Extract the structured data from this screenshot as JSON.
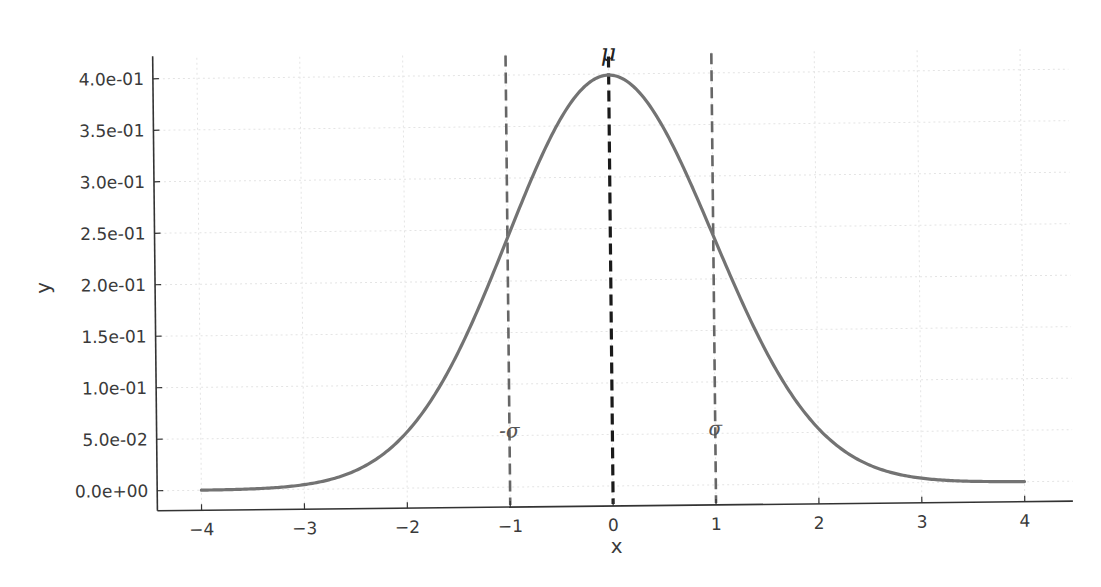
{
  "chart_data": {
    "type": "line",
    "title": "",
    "xlabel": "x",
    "ylabel": "y",
    "xlim": [
      -4.4,
      4.4
    ],
    "ylim": [
      -0.02,
      0.42
    ],
    "grid": true,
    "legend": null,
    "xticks": [
      -4,
      -3,
      -2,
      -1,
      0,
      1,
      2,
      3,
      4
    ],
    "xtick_labels": [
      "−4",
      "−3",
      "−2",
      "−1",
      "0",
      "1",
      "2",
      "3",
      "4"
    ],
    "yticks": [
      0.0,
      0.05,
      0.1,
      0.15,
      0.2,
      0.25,
      0.3,
      0.35,
      0.4
    ],
    "ytick_labels": [
      "0.0e+00",
      "5.0e-02",
      "1.0e-01",
      "1.5e-01",
      "2.0e-01",
      "2.5e-01",
      "3.0e-01",
      "3.5e-01",
      "4.0e-01"
    ],
    "series": [
      {
        "name": "Standard normal PDF",
        "function": "exp(-x^2/2)/sqrt(2*pi)",
        "x": [
          -4,
          -3.5,
          -3,
          -2.5,
          -2,
          -1.5,
          -1,
          -0.5,
          0,
          0.5,
          1,
          1.5,
          2,
          2.5,
          3,
          3.5,
          4
        ],
        "values": [
          0.0001,
          0.0009,
          0.0044,
          0.0175,
          0.054,
          0.1295,
          0.242,
          0.3521,
          0.3989,
          0.3521,
          0.242,
          0.1295,
          0.054,
          0.0175,
          0.0044,
          0.0009,
          0.0001
        ],
        "color": "#737373"
      }
    ],
    "vlines": [
      {
        "x": -1,
        "label": "-σ",
        "style": "dashed",
        "color": "#666666",
        "label_y": 0.055
      },
      {
        "x": 0,
        "label": "μ",
        "style": "dashed",
        "color": "#1a1a1a",
        "label_y": 0.415
      },
      {
        "x": 1,
        "label": "σ",
        "style": "dashed",
        "color": "#666666",
        "label_y": 0.055
      }
    ]
  }
}
